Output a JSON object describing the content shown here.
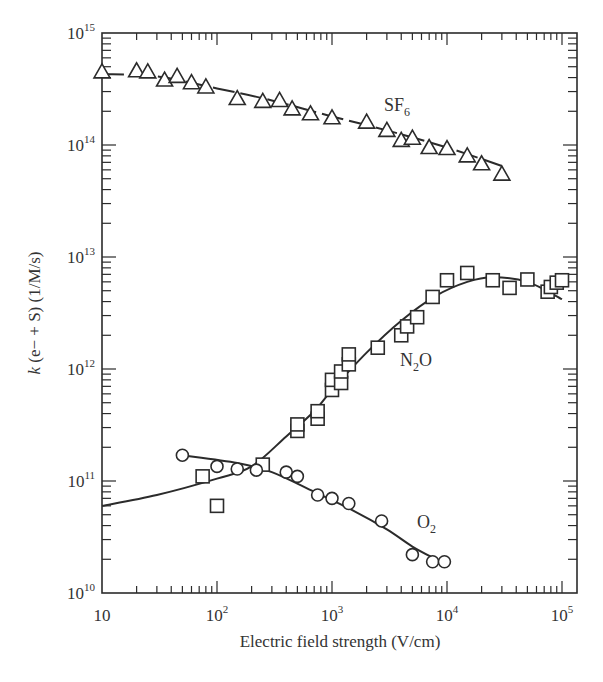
{
  "chart_data": {
    "type": "scatter",
    "title": "",
    "xlabel": "Electric field strength (V/cm)",
    "ylabel": "k (e− + S) (1/M/s)",
    "xscale": "log",
    "yscale": "log",
    "xlim": [
      10,
      100000
    ],
    "ylim": [
      10000000000.0,
      1000000000000000.0
    ],
    "grid": false,
    "legend": "inline labels",
    "x_ticks": [
      "10",
      "10^2",
      "10^3",
      "10^4",
      "10^5"
    ],
    "y_ticks": [
      "10^10",
      "10^11",
      "10^12",
      "10^13",
      "10^14",
      "10^15"
    ],
    "series": [
      {
        "name": "SF6",
        "label": "SF",
        "label_sub": "6",
        "marker": "triangle",
        "fit_style": "dashed",
        "points": [
          [
            10,
            450000000000000.0
          ],
          [
            20,
            460000000000000.0
          ],
          [
            25,
            450000000000000.0
          ],
          [
            35,
            380000000000000.0
          ],
          [
            45,
            410000000000000.0
          ],
          [
            60,
            360000000000000.0
          ],
          [
            80,
            330000000000000.0
          ],
          [
            150,
            260000000000000.0
          ],
          [
            250,
            245000000000000.0
          ],
          [
            350,
            250000000000000.0
          ],
          [
            450,
            210000000000000.0
          ],
          [
            650,
            190000000000000.0
          ],
          [
            1000,
            175000000000000.0
          ],
          [
            2000,
            160000000000000.0
          ],
          [
            3000,
            135000000000000.0
          ],
          [
            4000,
            110000000000000.0
          ],
          [
            5000,
            115000000000000.0
          ],
          [
            7000,
            95000000000000.0
          ],
          [
            10000,
            93000000000000.0
          ],
          [
            15000,
            80000000000000.0
          ],
          [
            20000,
            68000000000000.0
          ],
          [
            30000,
            55000000000000.0
          ]
        ],
        "fit": [
          [
            10,
            430000000000000.0
          ],
          [
            30,
            410000000000000.0
          ],
          [
            100,
            320000000000000.0
          ],
          [
            300,
            250000000000000.0
          ],
          [
            1000,
            180000000000000.0
          ],
          [
            3000,
            135000000000000.0
          ],
          [
            10000,
            95000000000000.0
          ],
          [
            30000,
            65000000000000.0
          ]
        ]
      },
      {
        "name": "N2O",
        "label": "N",
        "label_sub": "2",
        "label_tail": "O",
        "marker": "square",
        "fit_style": "solid",
        "points": [
          [
            75,
            110000000000.0
          ],
          [
            100,
            60000000000.0
          ],
          [
            250,
            140000000000.0
          ],
          [
            500,
            280000000000.0
          ],
          [
            500,
            320000000000.0
          ],
          [
            750,
            360000000000.0
          ],
          [
            750,
            420000000000.0
          ],
          [
            1000,
            650000000000.0
          ],
          [
            1000,
            800000000000.0
          ],
          [
            1200,
            750000000000.0
          ],
          [
            1200,
            950000000000.0
          ],
          [
            1400,
            1100000000000.0
          ],
          [
            1400,
            1350000000000.0
          ],
          [
            2500,
            1550000000000.0
          ],
          [
            4000,
            2000000000000.0
          ],
          [
            4500,
            2400000000000.0
          ],
          [
            5500,
            2900000000000.0
          ],
          [
            7500,
            4400000000000.0
          ],
          [
            10000,
            6200000000000.0
          ],
          [
            15000,
            7200000000000.0
          ],
          [
            25000,
            6200000000000.0
          ],
          [
            35000,
            5300000000000.0
          ],
          [
            50000,
            6300000000000.0
          ],
          [
            75000,
            4900000000000.0
          ],
          [
            80000,
            5400000000000.0
          ],
          [
            90000,
            5900000000000.0
          ],
          [
            100000,
            6200000000000.0
          ]
        ],
        "fit": [
          [
            10,
            60000000000.0
          ],
          [
            30,
            75000000000.0
          ],
          [
            100,
            105000000000.0
          ],
          [
            200,
            135000000000.0
          ],
          [
            400,
            250000000000.0
          ],
          [
            700,
            420000000000.0
          ],
          [
            1000,
            650000000000.0
          ],
          [
            2000,
            1400000000000.0
          ],
          [
            4000,
            2700000000000.0
          ],
          [
            8000,
            4500000000000.0
          ],
          [
            15000,
            6000000000000.0
          ],
          [
            25000,
            6600000000000.0
          ],
          [
            50000,
            6000000000000.0
          ],
          [
            100000,
            4200000000000.0
          ]
        ]
      },
      {
        "name": "O2",
        "label": "O",
        "label_sub": "2",
        "marker": "circle",
        "fit_style": "solid",
        "points": [
          [
            50,
            170000000000.0
          ],
          [
            100,
            135000000000.0
          ],
          [
            150,
            128000000000.0
          ],
          [
            220,
            125000000000.0
          ],
          [
            400,
            120000000000.0
          ],
          [
            500,
            110000000000.0
          ],
          [
            750,
            75000000000.0
          ],
          [
            1000,
            70000000000.0
          ],
          [
            1400,
            63000000000.0
          ],
          [
            2700,
            44000000000.0
          ],
          [
            5000,
            22000000000.0
          ],
          [
            7500,
            19000000000.0
          ],
          [
            9500,
            19000000000.0
          ]
        ],
        "fit": [
          [
            50,
            170000000000.0
          ],
          [
            150,
            145000000000.0
          ],
          [
            300,
            120000000000.0
          ],
          [
            700,
            80000000000.0
          ],
          [
            1500,
            55000000000.0
          ],
          [
            3000,
            37000000000.0
          ],
          [
            5000,
            26000000000.0
          ],
          [
            8000,
            20000000000.0
          ]
        ]
      }
    ]
  },
  "labels": {
    "x_axis_title": "Electric field strength (V/cm)",
    "y_axis_title_italic": "k",
    "y_axis_title_rest": " (e− + S) (1/M/s)",
    "x_tick_labels": [
      {
        "base": "10",
        "exp": ""
      },
      {
        "base": "10",
        "exp": "2"
      },
      {
        "base": "10",
        "exp": "3"
      },
      {
        "base": "10",
        "exp": "4"
      },
      {
        "base": "10",
        "exp": "5"
      }
    ],
    "y_tick_labels": [
      {
        "base": "10",
        "exp": "10"
      },
      {
        "base": "10",
        "exp": "11"
      },
      {
        "base": "10",
        "exp": "12"
      },
      {
        "base": "10",
        "exp": "13"
      },
      {
        "base": "10",
        "exp": "14"
      },
      {
        "base": "10",
        "exp": "15"
      }
    ],
    "sf6_label": "SF",
    "sf6_sub": "6",
    "n2o_label_n": "N",
    "n2o_sub": "2",
    "n2o_label_o": "O",
    "o2_label": "O",
    "o2_sub": "2"
  },
  "style": {
    "ink": "#2b2b2b",
    "background": "#ffffff"
  }
}
